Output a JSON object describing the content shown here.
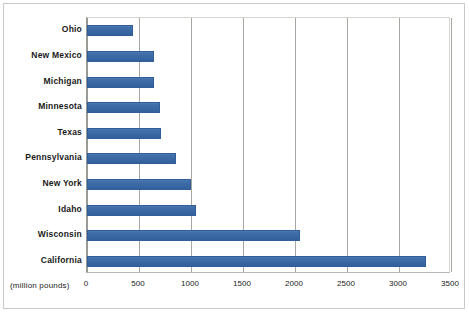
{
  "chart_data": {
    "type": "bar",
    "orientation": "horizontal",
    "title": "",
    "subtitle": "",
    "xlabel": "(million pounds)",
    "ylabel": "",
    "categories": [
      "Ohio",
      "New Mexico",
      "Michigan",
      "Minnesota",
      "Texas",
      "Pennsylvania",
      "New York",
      "Idaho",
      "Wisconsin",
      "California"
    ],
    "values": [
      445,
      640,
      640,
      700,
      715,
      860,
      1000,
      1050,
      2050,
      3260
    ],
    "xlim": [
      0,
      3500
    ],
    "xticks": [
      0,
      500,
      1000,
      1500,
      2000,
      2500,
      3000,
      3500
    ],
    "xtick_labels": [
      "0",
      "500",
      "1000",
      "1500",
      "2000",
      "2500",
      "3000",
      "3500"
    ],
    "grid": true,
    "grid_axis": "x",
    "legend": false,
    "legend_position": "none",
    "series": [
      {
        "name": "",
        "color": "#3A68A3",
        "values": [
          445,
          640,
          640,
          700,
          715,
          860,
          1000,
          1050,
          2050,
          3260
        ]
      }
    ],
    "colors": {
      "bar_fill": "#3A68A3",
      "bar_edge": "#315E99",
      "gridline": "#A8A8A3",
      "axis": "#9A9A95",
      "frame": "#C9C9C9",
      "text": "#1A1A1A",
      "background": "#FFFFFF"
    }
  }
}
